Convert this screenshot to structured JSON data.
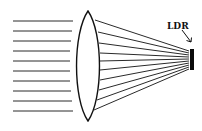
{
  "diagram": {
    "type": "optics-ray-diagram",
    "colors": {
      "background": "#ffffff",
      "lines": "#2a2a2a",
      "ldr": "#0a0a0a"
    },
    "labels": {
      "ldr": "LDR"
    },
    "incident_rays": [
      {
        "x1": 13,
        "x2": 73,
        "y": 21
      },
      {
        "x1": 13,
        "x2": 72,
        "y": 31
      },
      {
        "x1": 13,
        "x2": 71,
        "y": 41
      },
      {
        "x1": 13,
        "x2": 70,
        "y": 51
      },
      {
        "x1": 13,
        "x2": 70,
        "y": 61
      },
      {
        "x1": 13,
        "x2": 70,
        "y": 71
      },
      {
        "x1": 13,
        "x2": 70,
        "y": 81
      },
      {
        "x1": 13,
        "x2": 71,
        "y": 91
      },
      {
        "x1": 13,
        "x2": 72,
        "y": 101
      },
      {
        "x1": 13,
        "x2": 73,
        "y": 111
      }
    ],
    "lens": {
      "cx": 88,
      "top_y": 11,
      "bottom_y": 121,
      "half_width": 11.5
    },
    "refracted_rays": [
      {
        "x1": 95,
        "y1": 20,
        "x2": 189,
        "y2": 51
      },
      {
        "x1": 98,
        "y1": 32,
        "x2": 189,
        "y2": 53
      },
      {
        "x1": 99,
        "y1": 43,
        "x2": 189,
        "y2": 55
      },
      {
        "x1": 100,
        "y1": 53,
        "x2": 189,
        "y2": 57
      },
      {
        "x1": 100,
        "y1": 61,
        "x2": 189,
        "y2": 59
      },
      {
        "x1": 100,
        "y1": 70,
        "x2": 189,
        "y2": 61
      },
      {
        "x1": 100,
        "y1": 80,
        "x2": 189,
        "y2": 63
      },
      {
        "x1": 99,
        "y1": 90,
        "x2": 189,
        "y2": 65
      },
      {
        "x1": 97,
        "y1": 100,
        "x2": 189,
        "y2": 67
      },
      {
        "x1": 94,
        "y1": 110,
        "x2": 189,
        "y2": 69
      }
    ],
    "ldr": {
      "x": 190,
      "y": 49,
      "width": 4,
      "height": 21
    },
    "arrow": {
      "x1": 182,
      "y1": 30,
      "x2": 191,
      "y2": 42
    }
  }
}
